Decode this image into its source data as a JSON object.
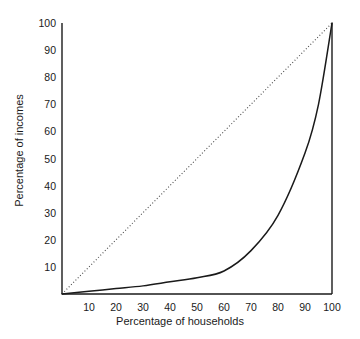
{
  "chart_data": {
    "type": "line",
    "title": "",
    "xlabel": "Percentage of households",
    "ylabel": "Percentage of incomes",
    "xlim": [
      0,
      100
    ],
    "ylim": [
      0,
      100
    ],
    "grid": false,
    "legend": "none",
    "xticks": [
      "10",
      "20",
      "30",
      "40",
      "50",
      "60",
      "70",
      "80",
      "90",
      "100"
    ],
    "xtick_values": [
      10,
      20,
      30,
      40,
      50,
      60,
      70,
      80,
      90,
      100
    ],
    "yticks": [
      "10",
      "20",
      "30",
      "40",
      "50",
      "60",
      "70",
      "80",
      "90",
      "100"
    ],
    "ytick_values": [
      10,
      20,
      30,
      40,
      50,
      60,
      70,
      80,
      90,
      100
    ],
    "series": [
      {
        "name": "Line of equality",
        "style": "dotted",
        "color": "#4a4a4a",
        "x": [
          0,
          100
        ],
        "values": [
          0,
          100
        ]
      },
      {
        "name": "Lorenz curve",
        "style": "solid",
        "color": "#1a1a1a",
        "x": [
          0,
          10,
          20,
          30,
          40,
          50,
          60,
          70,
          80,
          90,
          95,
          100
        ],
        "values": [
          0,
          1,
          2,
          3,
          4.5,
          6,
          8.5,
          16,
          29,
          52,
          70,
          100
        ]
      }
    ],
    "annotations": []
  },
  "axes": {
    "left_spine": "visible",
    "bottom_spine": "visible",
    "right_spine": "visible",
    "top_spine": "hidden",
    "axis_color": "#1a1a1a"
  },
  "colors": {
    "background": "#ffffff",
    "ink": "#1a1a1a",
    "dotted": "#4a4a4a"
  }
}
